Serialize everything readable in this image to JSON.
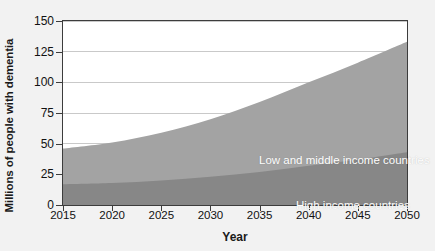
{
  "chart_data": {
    "type": "area",
    "stacked": true,
    "title": "",
    "subtitle": "",
    "xlabel": "Year",
    "ylabel": "Millions of people with dementia",
    "x": [
      2015,
      2020,
      2025,
      2030,
      2035,
      2040,
      2045,
      2050
    ],
    "xlim": [
      2015,
      2050
    ],
    "ylim": [
      0,
      150
    ],
    "xticks": [
      "2015",
      "2020",
      "2025",
      "2030",
      "2035",
      "2040",
      "2045",
      "2050"
    ],
    "yticks": [
      "0",
      "25",
      "50",
      "75",
      "100",
      "125",
      "150"
    ],
    "grid": "horizontal",
    "legend_position": "inline-on-bands",
    "series": [
      {
        "name": "High income countries",
        "color": "#878787",
        "values": [
          17,
          18,
          20,
          23,
          27,
          32,
          37,
          43
        ]
      },
      {
        "name": "Low and middle income countries",
        "color": "#a3a3a3",
        "values": [
          29,
          33,
          39,
          47,
          57,
          68,
          79,
          90
        ]
      }
    ],
    "totals": [
      46,
      51,
      59,
      70,
      84,
      100,
      116,
      133
    ],
    "annotations": [
      {
        "text": "Low and middle income countries",
        "series": "Low and middle income countries"
      },
      {
        "text": "High income countries",
        "series": "High income countries"
      }
    ]
  },
  "axes": {
    "y_title": "Millions of people with dementia",
    "x_title": "Year",
    "y_ticks": [
      "150",
      "125",
      "100",
      "75",
      "50",
      "25",
      "0"
    ],
    "x_ticks": [
      "2015",
      "2020",
      "2025",
      "2030",
      "2035",
      "2040",
      "2045",
      "2050"
    ]
  },
  "labels": {
    "low_middle": "Low and middle income countries",
    "high": "High income countries"
  },
  "colors": {
    "band_low_middle": "#a3a3a3",
    "band_high": "#878787",
    "gridline": "#c9c9c9",
    "axis": "#3c3c3c",
    "plot_background": "#ffffff",
    "page_background": "#f2f2f2",
    "text": "#111111",
    "label_text": "#ffffff"
  }
}
